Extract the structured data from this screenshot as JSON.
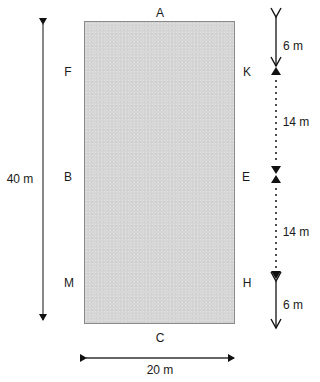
{
  "diagram": {
    "type": "rectangular field with marked points and dimensions",
    "field": {
      "fill_color": "#d6d6d6",
      "border_color": "#8a8a8a"
    },
    "points": {
      "top": "A",
      "bottom": "C",
      "left_upper": "F",
      "left_middle": "B",
      "left_lower": "M",
      "right_upper": "K",
      "right_middle": "E",
      "right_lower": "H"
    },
    "dimensions": {
      "height": "40 m",
      "width": "20 m",
      "top_to_K": "6 m",
      "K_to_E": "14 m",
      "E_to_H": "14 m",
      "H_to_bottom": "6 m"
    }
  }
}
